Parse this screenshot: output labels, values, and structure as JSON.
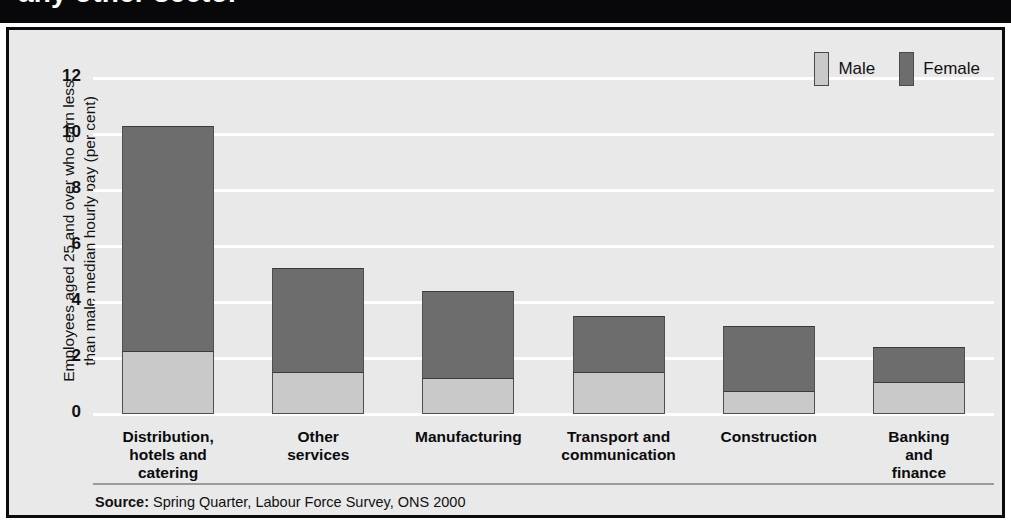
{
  "title": {
    "text": "any other sector"
  },
  "axis": {
    "y_title": "Employees aged 25 and over who earn less\nthan male median hourly pay (per cent)",
    "ticks": [
      "12",
      "10",
      "8",
      "6",
      "4",
      "2",
      "0"
    ]
  },
  "legend": [
    {
      "label": "Male",
      "color": "#c9c9c9"
    },
    {
      "label": "Female",
      "color": "#6d6d6d"
    }
  ],
  "source": {
    "prefix": "Source:",
    "text": " Spring Quarter, Labour Force Survey, ONS 2000"
  },
  "chart_data": {
    "type": "bar",
    "title": "any other sector",
    "xlabel": "",
    "ylabel": "Employees aged 25 and over who earn less than male median hourly pay (per cent)",
    "ylim": [
      0,
      12
    ],
    "yticks": [
      0,
      2,
      4,
      6,
      8,
      10,
      12
    ],
    "grid": true,
    "stacked": true,
    "legend_position": "top-right",
    "categories": [
      "Distribution,\nhotels and\ncatering",
      "Other\nservices",
      "Manufacturing",
      "Transport and\ncommunication",
      "Construction",
      "Banking\nand\nfinance"
    ],
    "series": [
      {
        "name": "Male",
        "color": "#c9c9c9",
        "values": [
          2.2,
          1.45,
          1.25,
          1.45,
          0.8,
          1.1
        ]
      },
      {
        "name": "Female",
        "color": "#6d6d6d",
        "values": [
          8.1,
          3.75,
          3.15,
          2.05,
          2.35,
          1.3
        ]
      }
    ],
    "totals": [
      10.3,
      5.2,
      4.4,
      3.5,
      3.15,
      2.4
    ],
    "source": "Source: Spring Quarter, Labour Force Survey, ONS 2000"
  }
}
